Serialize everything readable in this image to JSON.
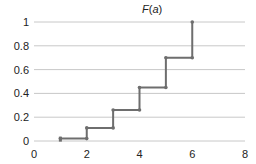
{
  "chart_data": {
    "type": "line",
    "subtype": "step",
    "title": "F(a)",
    "title_parts": {
      "fn": "F",
      "open": "(",
      "var": "a",
      "close": ")"
    },
    "xlabel": "",
    "ylabel": "",
    "xlim": [
      0,
      8
    ],
    "ylim": [
      0,
      1
    ],
    "xticks": [
      0,
      2,
      4,
      6,
      8
    ],
    "yticks": [
      0,
      0.2,
      0.4,
      0.6,
      0.8,
      1
    ],
    "ytick_labels": [
      "0",
      "0.2",
      "0.4",
      "0.6",
      "0.8",
      "1"
    ],
    "xtick_labels": [
      "0",
      "2",
      "4",
      "6",
      "8"
    ],
    "grid": {
      "horizontal": true,
      "vertical": false
    },
    "legend": null,
    "series": [
      {
        "name": "F(a)",
        "color": "#6e6e6e",
        "points": [
          {
            "x": 1,
            "y": 0.02
          },
          {
            "x": 2,
            "y": 0.11
          },
          {
            "x": 3,
            "y": 0.26
          },
          {
            "x": 4,
            "y": 0.45
          },
          {
            "x": 5,
            "y": 0.7
          },
          {
            "x": 6,
            "y": 1.0
          }
        ]
      }
    ]
  },
  "colors": {
    "grid": "#c8c8c8",
    "line": "#6e6e6e",
    "text": "#222222"
  }
}
